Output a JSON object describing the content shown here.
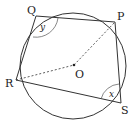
{
  "diagram": {
    "type": "cyclic-quadrilateral",
    "points": {
      "P": "P",
      "Q": "Q",
      "R": "R",
      "S": "S",
      "O": "O"
    },
    "angles": {
      "at_Q": "y",
      "at_S": "x"
    },
    "edges": [
      "QP",
      "PS",
      "SR",
      "RQ"
    ],
    "dashed": [
      "RO",
      "OP"
    ]
  }
}
